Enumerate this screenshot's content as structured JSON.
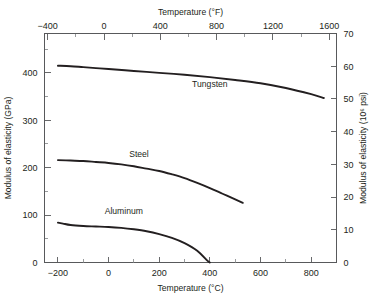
{
  "chart_data": {
    "type": "line",
    "title": "",
    "background": "#ffffff",
    "line_color": "#231f20",
    "axis_color": "#58595b",
    "grid": false,
    "legend_position": "inline-labels",
    "axes": {
      "bottom": {
        "label": "Temperature (°C)",
        "ticks": [
          -200,
          0,
          200,
          400,
          600,
          800
        ],
        "ticklabels": [
          "−200",
          "0",
          "200",
          "400",
          "600",
          "800"
        ],
        "minor_step": 100,
        "range": [
          -253,
          900
        ]
      },
      "top": {
        "label": "Temperature (°F)",
        "ticks": [
          -400,
          0,
          400,
          800,
          1200,
          1600
        ],
        "ticklabels": [
          "−400",
          "0",
          "400",
          "800",
          "1200",
          "1600"
        ],
        "minor_step": 200,
        "range": [
          -423,
          1652
        ]
      },
      "left": {
        "label": "Modulus of elasticity (GPa)",
        "ticks": [
          0,
          100,
          200,
          300,
          400
        ],
        "ticklabels": [
          "0",
          "100",
          "200",
          "300",
          "400"
        ],
        "minor_step": 50,
        "range": [
          0,
          483
        ]
      },
      "right": {
        "label": "Modulus of elasticity (10⁶ psi)",
        "ticks": [
          0,
          10,
          20,
          30,
          40,
          50,
          60,
          70
        ],
        "ticklabels": [
          "0",
          "10",
          "20",
          "30",
          "40",
          "50",
          "60",
          "70"
        ],
        "range": [
          0,
          70
        ]
      }
    },
    "series": [
      {
        "name": "Tungsten",
        "label": "Tungsten",
        "label_x": 400,
        "label_y": 370,
        "points": [
          [
            -200,
            415
          ],
          [
            -150,
            414
          ],
          [
            -100,
            412
          ],
          [
            -50,
            410
          ],
          [
            0,
            408
          ],
          [
            100,
            404
          ],
          [
            200,
            400
          ],
          [
            300,
            396
          ],
          [
            400,
            391
          ],
          [
            500,
            385
          ],
          [
            600,
            378
          ],
          [
            700,
            368
          ],
          [
            800,
            355
          ],
          [
            850,
            347
          ]
        ]
      },
      {
        "name": "Steel",
        "label": "Steel",
        "label_x": 120,
        "label_y": 222,
        "points": [
          [
            -200,
            216
          ],
          [
            -150,
            215
          ],
          [
            -100,
            214
          ],
          [
            -50,
            212
          ],
          [
            0,
            210
          ],
          [
            50,
            207
          ],
          [
            100,
            203
          ],
          [
            150,
            198
          ],
          [
            200,
            193
          ],
          [
            250,
            186
          ],
          [
            300,
            178
          ],
          [
            350,
            168
          ],
          [
            400,
            157
          ],
          [
            450,
            145
          ],
          [
            500,
            133
          ],
          [
            530,
            126
          ]
        ]
      },
      {
        "name": "Aluminum",
        "label": "Aluminum",
        "label_x": 60,
        "label_y": 102,
        "points": [
          [
            -200,
            84
          ],
          [
            -180,
            82
          ],
          [
            -150,
            79
          ],
          [
            -100,
            77
          ],
          [
            -50,
            76
          ],
          [
            0,
            75
          ],
          [
            50,
            73
          ],
          [
            100,
            70
          ],
          [
            150,
            66
          ],
          [
            200,
            60
          ],
          [
            250,
            52
          ],
          [
            300,
            41
          ],
          [
            350,
            25
          ],
          [
            390,
            4
          ],
          [
            400,
            0
          ]
        ]
      }
    ]
  }
}
